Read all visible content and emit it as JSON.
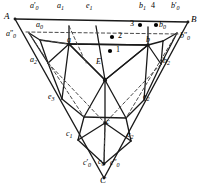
{
  "figure": {
    "type": "geometric-construction",
    "stroke_color": "#1a1a1a",
    "dashed_color": "#555555",
    "background": "#ffffff",
    "width": 202,
    "height": 188
  },
  "vertices": [
    {
      "id": "A",
      "label": "A",
      "x": 13,
      "y": 17
    },
    {
      "id": "B",
      "label": "B",
      "x": 190,
      "y": 20
    },
    {
      "id": "C",
      "label": "C",
      "x": 104,
      "y": 180
    }
  ],
  "labels": {
    "A": "A",
    "B": "B",
    "C": "C",
    "a": "a",
    "b": "b",
    "c": "c",
    "E": "E",
    "a0": "a",
    "a0_sub": "0",
    "a0_prime": "a",
    "a0_prime_sub": "0",
    "a0_dprime": "a",
    "a0_dprime_sub": "0",
    "a1": "a",
    "a1_sub": "1",
    "a2": "a",
    "a2_sub": "2",
    "b0": "b",
    "b0_sub": "0",
    "b0_prime": "b",
    "b0_prime_sub": "0",
    "b0_dprime": "b",
    "b0_dprime_sub": "0",
    "b1": "b",
    "b1_sub": "1",
    "b2": "b",
    "b2_sub": "2",
    "c0": "c",
    "c0_sub": "0",
    "c0_prime": "c",
    "c0_prime_sub": "0",
    "c0_dprime": "c",
    "c0_dprime_sub": "0",
    "c1": "c",
    "c1_sub": "1",
    "c2": "c",
    "c2_sub": "2",
    "e1": "e",
    "e1_sub": "1",
    "e2": "e",
    "e2_sub": "2",
    "e3": "e",
    "e3_sub": "3"
  },
  "markers": [
    {
      "id": "1",
      "label": "1",
      "x": 110,
      "y": 51,
      "label_x": 116,
      "label_y": 48
    },
    {
      "id": "2",
      "label": "2",
      "x": 112,
      "y": 37,
      "label_x": 118,
      "label_y": 34
    },
    {
      "id": "3",
      "label": "3",
      "x": 140,
      "y": 25,
      "label_x": 131,
      "label_y": 22
    },
    {
      "id": "4",
      "label": "4",
      "x": 156,
      "y": 25,
      "label_x": 151,
      "label_y": 10
    }
  ],
  "tick_label_4": "4"
}
